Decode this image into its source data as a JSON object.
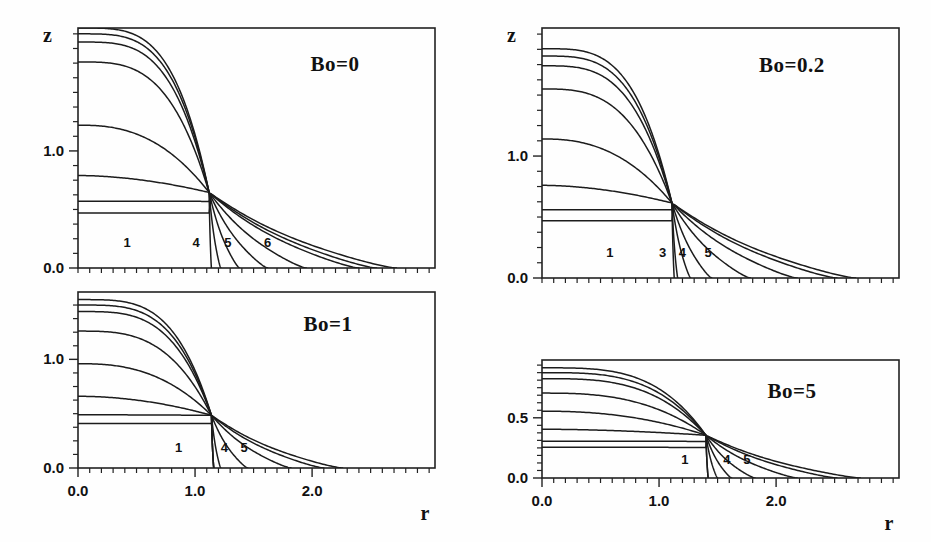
{
  "figure": {
    "background_color": "#fefefe",
    "line_color": "#1c1c1c"
  },
  "chart_data": [
    {
      "type": "line",
      "title": "Bo=0",
      "panel_id": "bo-0",
      "bond_number": 0,
      "xlabel": "",
      "ylabel": "z",
      "xlim": [
        0.0,
        3.05
      ],
      "ylim": [
        0.0,
        2.05
      ],
      "xticks_major": [],
      "xticks_major_labels": [],
      "yticks_major": [
        0.0,
        1.0
      ],
      "yticks_major_labels": [
        "0.0",
        "1.0"
      ],
      "ytick_minor_step": 0.125,
      "xtick_minor_step": 0.1,
      "grid": false,
      "legend": "none",
      "curve_labels": [
        {
          "text": "1",
          "r": 0.42,
          "z": 0.18
        },
        {
          "text": "4",
          "r": 1.01,
          "z": 0.18
        },
        {
          "text": "5",
          "r": 1.28,
          "z": 0.18
        },
        {
          "text": "6",
          "r": 1.62,
          "z": 0.18
        }
      ],
      "series": [
        {
          "name": "c1",
          "apex_z": 0.47,
          "neck_r": 1.12,
          "neck_z": 0.645,
          "foot_r": 2.72,
          "drop_r": 0.0,
          "type": "meniscus"
        },
        {
          "name": "c2",
          "apex_z": 0.57,
          "neck_r": 1.12,
          "neck_z": 0.645,
          "foot_r": 2.55,
          "drop_r": 0.0,
          "type": "meniscus"
        },
        {
          "name": "c3",
          "apex_z": 0.79,
          "neck_r": 1.12,
          "neck_z": 0.645,
          "foot_r": 2.4,
          "drop_r": 0.0,
          "type": "meniscus"
        },
        {
          "name": "c4",
          "apex_z": 1.22,
          "neck_r": 1.12,
          "neck_z": 0.645,
          "foot_r": 1.95,
          "drop_r": 0.0,
          "type": "meniscus"
        },
        {
          "name": "c5",
          "apex_z": 1.76,
          "neck_r": 1.12,
          "neck_z": 0.645,
          "foot_r": 1.62,
          "drop_r": 0.0,
          "type": "meniscus"
        },
        {
          "name": "c6",
          "apex_z": 1.93,
          "neck_r": 1.12,
          "neck_z": 0.645,
          "foot_r": 1.38,
          "drop_r": 0.0,
          "type": "meniscus"
        },
        {
          "name": "c7",
          "apex_z": 2.0,
          "neck_r": 1.12,
          "neck_z": 0.645,
          "foot_r": 1.22,
          "drop_r": 0.0,
          "type": "meniscus"
        },
        {
          "name": "c8",
          "apex_z": 2.05,
          "neck_r": 1.12,
          "neck_z": 0.645,
          "foot_r": 1.13,
          "drop_r": 0.0,
          "type": "meniscus"
        }
      ]
    },
    {
      "type": "line",
      "title": "Bo=0.2",
      "panel_id": "bo-02",
      "bond_number": 0.2,
      "xlabel": "",
      "ylabel": "z",
      "xlim": [
        0.0,
        3.05
      ],
      "ylim": [
        0.0,
        2.05
      ],
      "xticks_major": [],
      "xticks_major_labels": [],
      "yticks_major": [
        0.0,
        1.0
      ],
      "yticks_major_labels": [
        "0.0",
        "1.0"
      ],
      "ytick_minor_step": 0.125,
      "xtick_minor_step": 0.1,
      "grid": false,
      "legend": "none",
      "curve_labels": [
        {
          "text": "1",
          "r": 0.58,
          "z": 0.17
        },
        {
          "text": "3",
          "r": 1.03,
          "z": 0.17
        },
        {
          "text": "4",
          "r": 1.2,
          "z": 0.17
        },
        {
          "text": "5",
          "r": 1.42,
          "z": 0.17
        }
      ],
      "series": [
        {
          "name": "c1",
          "apex_z": 0.47,
          "neck_r": 1.11,
          "neck_z": 0.615,
          "foot_r": 2.68,
          "drop_r": 0.0,
          "type": "meniscus"
        },
        {
          "name": "c2",
          "apex_z": 0.56,
          "neck_r": 1.11,
          "neck_z": 0.615,
          "foot_r": 2.52,
          "drop_r": 0.0,
          "type": "meniscus"
        },
        {
          "name": "c3",
          "apex_z": 0.76,
          "neck_r": 1.11,
          "neck_z": 0.615,
          "foot_r": 2.18,
          "drop_r": 0.0,
          "type": "meniscus"
        },
        {
          "name": "c4",
          "apex_z": 1.14,
          "neck_r": 1.11,
          "neck_z": 0.615,
          "foot_r": 1.78,
          "drop_r": 0.0,
          "type": "meniscus"
        },
        {
          "name": "c5",
          "apex_z": 1.55,
          "neck_r": 1.11,
          "neck_z": 0.615,
          "foot_r": 1.45,
          "drop_r": 0.0,
          "type": "meniscus"
        },
        {
          "name": "c6",
          "apex_z": 1.74,
          "neck_r": 1.11,
          "neck_z": 0.615,
          "foot_r": 1.27,
          "drop_r": 0.0,
          "type": "meniscus"
        },
        {
          "name": "c7",
          "apex_z": 1.82,
          "neck_r": 1.11,
          "neck_z": 0.615,
          "foot_r": 1.16,
          "drop_r": 0.0,
          "type": "meniscus"
        },
        {
          "name": "c8",
          "apex_z": 1.88,
          "neck_r": 1.11,
          "neck_z": 0.615,
          "foot_r": 1.08,
          "drop_r": 0.0,
          "type": "meniscus"
        }
      ]
    },
    {
      "type": "line",
      "title": "Bo=1",
      "panel_id": "bo-1",
      "bond_number": 1,
      "xlabel": "r",
      "ylabel": "",
      "xlim": [
        0.0,
        3.05
      ],
      "ylim": [
        0.0,
        1.62
      ],
      "xticks_major": [
        0.0,
        1.0,
        2.0
      ],
      "xticks_major_labels": [
        "0.0",
        "1.0",
        "2.0"
      ],
      "yticks_major": [
        0.0,
        1.0
      ],
      "yticks_major_labels": [
        "0.0",
        "1.0"
      ],
      "ytick_minor_step": 0.125,
      "xtick_minor_step": 0.1,
      "grid": false,
      "legend": "none",
      "curve_labels": [
        {
          "text": "1",
          "r": 0.86,
          "z": 0.145
        },
        {
          "text": "4",
          "r": 1.25,
          "z": 0.145
        },
        {
          "text": "5",
          "r": 1.42,
          "z": 0.145
        }
      ],
      "series": [
        {
          "name": "c1",
          "apex_z": 0.41,
          "neck_r": 1.14,
          "neck_z": 0.485,
          "foot_r": 2.26,
          "drop_r": 0.0,
          "type": "meniscus"
        },
        {
          "name": "c2",
          "apex_z": 0.49,
          "neck_r": 1.14,
          "neck_z": 0.485,
          "foot_r": 2.1,
          "drop_r": 0.0,
          "type": "meniscus"
        },
        {
          "name": "c3",
          "apex_z": 0.66,
          "neck_r": 1.14,
          "neck_z": 0.485,
          "foot_r": 1.82,
          "drop_r": 0.0,
          "type": "meniscus"
        },
        {
          "name": "c4",
          "apex_z": 0.96,
          "neck_r": 1.14,
          "neck_z": 0.485,
          "foot_r": 1.45,
          "drop_r": 0.0,
          "type": "meniscus"
        },
        {
          "name": "c5",
          "apex_z": 1.26,
          "neck_r": 1.14,
          "neck_z": 0.485,
          "foot_r": 1.22,
          "drop_r": 0.0,
          "type": "meniscus"
        },
        {
          "name": "c6",
          "apex_z": 1.44,
          "neck_r": 1.14,
          "neck_z": 0.485,
          "foot_r": 1.08,
          "drop_r": 0.0,
          "type": "meniscus"
        },
        {
          "name": "c7",
          "apex_z": 1.5,
          "neck_r": 1.14,
          "neck_z": 0.485,
          "foot_r": 0.98,
          "drop_r": 0.0,
          "type": "meniscus"
        },
        {
          "name": "c8",
          "apex_z": 1.55,
          "neck_r": 1.14,
          "neck_z": 0.485,
          "foot_r": 0.9,
          "drop_r": 0.0,
          "type": "meniscus"
        }
      ]
    },
    {
      "type": "line",
      "title": "Bo=5",
      "panel_id": "bo-5",
      "bond_number": 5,
      "xlabel": "r",
      "ylabel": "",
      "xlim": [
        0.0,
        3.05
      ],
      "ylim": [
        0.0,
        0.98
      ],
      "xticks_major": [
        0.0,
        1.0,
        2.0
      ],
      "xticks_major_labels": [
        "0.0",
        "1.0",
        "2.0"
      ],
      "yticks_major": [
        0.0,
        0.5
      ],
      "yticks_major_labels": [
        "0.0",
        "0.5"
      ],
      "ytick_minor_step": 0.0625,
      "xtick_minor_step": 0.1,
      "grid": false,
      "legend": "none",
      "curve_labels": [
        {
          "text": "1",
          "r": 1.22,
          "z": 0.115
        },
        {
          "text": "4",
          "r": 1.58,
          "z": 0.115
        },
        {
          "text": "5",
          "r": 1.75,
          "z": 0.115
        }
      ],
      "series": [
        {
          "name": "c1",
          "apex_z": 0.255,
          "neck_r": 1.4,
          "neck_z": 0.355,
          "foot_r": 2.72,
          "drop_r": 0.0,
          "type": "meniscus"
        },
        {
          "name": "c2",
          "apex_z": 0.305,
          "neck_r": 1.4,
          "neck_z": 0.355,
          "foot_r": 2.52,
          "drop_r": 0.0,
          "type": "meniscus"
        },
        {
          "name": "c3",
          "apex_z": 0.405,
          "neck_r": 1.4,
          "neck_z": 0.355,
          "foot_r": 2.18,
          "drop_r": 0.0,
          "type": "meniscus"
        },
        {
          "name": "c4",
          "apex_z": 0.555,
          "neck_r": 1.4,
          "neck_z": 0.355,
          "foot_r": 1.82,
          "drop_r": 0.0,
          "type": "meniscus"
        },
        {
          "name": "c5",
          "apex_z": 0.705,
          "neck_r": 1.4,
          "neck_z": 0.355,
          "foot_r": 1.62,
          "drop_r": 0.0,
          "type": "meniscus"
        },
        {
          "name": "c6",
          "apex_z": 0.825,
          "neck_r": 1.4,
          "neck_z": 0.355,
          "foot_r": 1.5,
          "drop_r": 0.0,
          "type": "meniscus"
        },
        {
          "name": "c7",
          "apex_z": 0.875,
          "neck_r": 1.4,
          "neck_z": 0.355,
          "foot_r": 1.4,
          "drop_r": 0.0,
          "type": "meniscus"
        },
        {
          "name": "c8",
          "apex_z": 0.915,
          "neck_r": 1.4,
          "neck_z": 0.355,
          "foot_r": 1.28,
          "drop_r": 0.0,
          "type": "meniscus"
        }
      ]
    }
  ],
  "layout": {
    "panels": [
      {
        "id": "bo-0",
        "left": 78,
        "top": 28,
        "width": 357,
        "height": 240,
        "show_x_labels": false,
        "show_y_label_title": true,
        "bo_x": 0.72,
        "bo_y": 0.88
      },
      {
        "id": "bo-02",
        "left": 542,
        "top": 28,
        "width": 357,
        "height": 250,
        "show_x_labels": false,
        "show_y_label_title": true,
        "bo_x": 0.7,
        "bo_y": 0.88
      },
      {
        "id": "bo-1",
        "left": 78,
        "top": 292,
        "width": 357,
        "height": 176,
        "show_x_labels": true,
        "show_y_label_title": false,
        "bo_x": 0.7,
        "bo_y": 0.86
      },
      {
        "id": "bo-5",
        "left": 542,
        "top": 360,
        "width": 357,
        "height": 118,
        "show_x_labels": true,
        "show_y_label_title": false,
        "bo_x": 0.7,
        "bo_y": 0.8
      }
    ],
    "ylabel_text": "z",
    "xlabel_text": "r"
  }
}
